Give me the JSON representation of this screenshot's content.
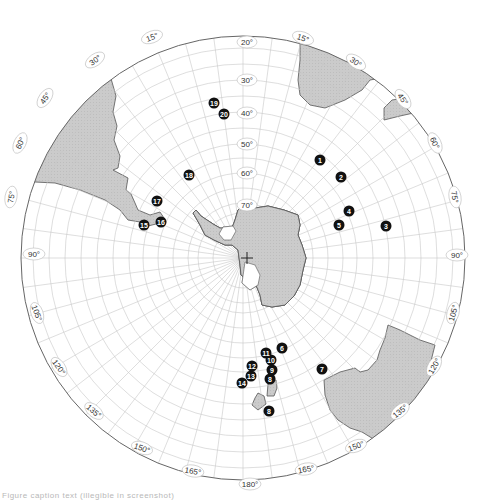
{
  "map": {
    "type": "south-polar-projection",
    "center_symbol": "+",
    "colors": {
      "land": "#c9c9c9",
      "land_outline": "#555555",
      "grid": "#c8c8c8",
      "rim": "#666666",
      "marker": "#111111",
      "marker_text": "#ffffff",
      "label_bg": "#ffffff"
    },
    "longitude_labels": [
      {
        "text": "15°",
        "x": 152,
        "y": 37,
        "rot": -20
      },
      {
        "text": "30°",
        "x": 95,
        "y": 60,
        "rot": -35
      },
      {
        "text": "45°",
        "x": 45,
        "y": 98,
        "rot": -55
      },
      {
        "text": "60°",
        "x": 20,
        "y": 143,
        "rot": -65
      },
      {
        "text": "75°",
        "x": 11,
        "y": 197,
        "rot": -80
      },
      {
        "text": "90°",
        "x": 34,
        "y": 254,
        "rot": 0
      },
      {
        "text": "105°",
        "x": 37,
        "y": 313,
        "rot": 70
      },
      {
        "text": "120°",
        "x": 59,
        "y": 367,
        "rot": 55
      },
      {
        "text": "135°",
        "x": 94,
        "y": 411,
        "rot": 40
      },
      {
        "text": "150°",
        "x": 142,
        "y": 448,
        "rot": 20
      },
      {
        "text": "165°",
        "x": 193,
        "y": 471,
        "rot": 10
      },
      {
        "text": "180°",
        "x": 250,
        "y": 484,
        "rot": 0
      },
      {
        "text": "165°",
        "x": 306,
        "y": 469,
        "rot": -10
      },
      {
        "text": "150°",
        "x": 356,
        "y": 446,
        "rot": -20
      },
      {
        "text": "135°",
        "x": 400,
        "y": 411,
        "rot": -40
      },
      {
        "text": "120°",
        "x": 434,
        "y": 366,
        "rot": -60
      },
      {
        "text": "105°",
        "x": 453,
        "y": 313,
        "rot": -75
      },
      {
        "text": "90°",
        "x": 457,
        "y": 255,
        "rot": 0
      },
      {
        "text": "75°",
        "x": 455,
        "y": 197,
        "rot": 80
      },
      {
        "text": "60°",
        "x": 435,
        "y": 143,
        "rot": 65
      },
      {
        "text": "45°",
        "x": 403,
        "y": 99,
        "rot": 55
      },
      {
        "text": "30°",
        "x": 356,
        "y": 62,
        "rot": 35
      },
      {
        "text": "15°",
        "x": 303,
        "y": 38,
        "rot": 20
      }
    ],
    "latitude_labels": [
      {
        "text": "20°",
        "x": 247,
        "y": 42
      },
      {
        "text": "30°",
        "x": 247,
        "y": 80
      },
      {
        "text": "40°",
        "x": 247,
        "y": 113
      },
      {
        "text": "50°",
        "x": 247,
        "y": 144
      },
      {
        "text": "60°",
        "x": 247,
        "y": 173
      },
      {
        "text": "70°",
        "x": 247,
        "y": 205
      }
    ],
    "markers": [
      {
        "id": "1",
        "x": 320,
        "y": 160
      },
      {
        "id": "2",
        "x": 341,
        "y": 177
      },
      {
        "id": "3",
        "x": 386,
        "y": 226
      },
      {
        "id": "4",
        "x": 349,
        "y": 211
      },
      {
        "id": "5",
        "x": 339,
        "y": 225
      },
      {
        "id": "6",
        "x": 282,
        "y": 348
      },
      {
        "id": "7",
        "x": 322,
        "y": 369
      },
      {
        "id": "8",
        "x": 270,
        "y": 379
      },
      {
        "id": "9",
        "x": 272,
        "y": 370
      },
      {
        "id": "10",
        "x": 271,
        "y": 360
      },
      {
        "id": "11",
        "x": 266,
        "y": 353
      },
      {
        "id": "12",
        "x": 252,
        "y": 366
      },
      {
        "id": "13",
        "x": 251,
        "y": 376
      },
      {
        "id": "14",
        "x": 242,
        "y": 383
      },
      {
        "id": "15",
        "x": 144,
        "y": 225
      },
      {
        "id": "16",
        "x": 161,
        "y": 222
      },
      {
        "id": "17",
        "x": 157,
        "y": 201
      },
      {
        "id": "18",
        "x": 189,
        "y": 175
      },
      {
        "id": "19",
        "x": 214,
        "y": 103
      },
      {
        "id": "20",
        "x": 224,
        "y": 114
      },
      {
        "id": "8",
        "x": 269,
        "y": 411
      }
    ]
  },
  "caption": "Figure caption text (illegible in screenshot)"
}
